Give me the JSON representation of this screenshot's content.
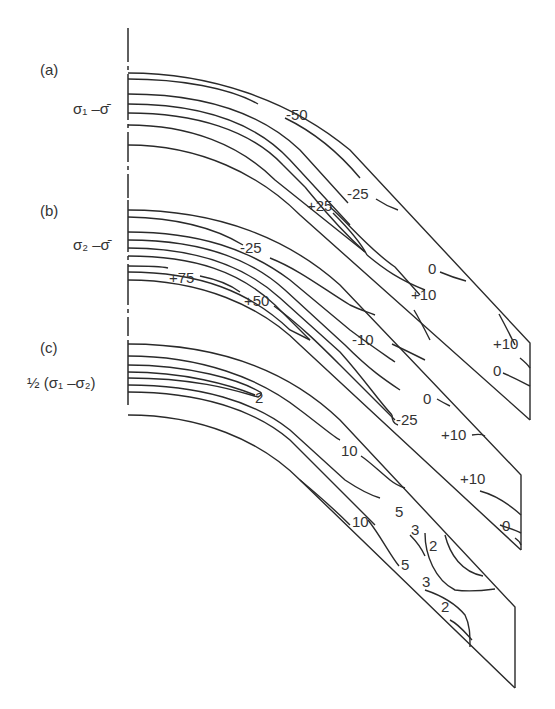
{
  "figure": {
    "type": "contour-diagram",
    "panels": [
      {
        "id": "a",
        "label": "(a)",
        "quantity": "σ₁ - σ̄",
        "quantity_display": "σ₁ –σ̄",
        "contour_labels": [
          "-50",
          "-25",
          "+25",
          "0",
          "+10",
          "+10",
          "0"
        ]
      },
      {
        "id": "b",
        "label": "(b)",
        "quantity": "σ₂ - σ̄",
        "quantity_display": "σ₂ –σ̄",
        "contour_labels": [
          "-25",
          "+75",
          "+50",
          "-10",
          "0",
          "-25",
          "+10",
          "+10",
          "0"
        ]
      },
      {
        "id": "c",
        "label": "(c)",
        "quantity": "½ (σ₁ - σ₂)",
        "quantity_display": "½ (σ₁ –σ₂)",
        "contour_labels": [
          "2",
          "10",
          "10",
          "5",
          "3",
          "2",
          "5",
          "3",
          "2"
        ]
      }
    ],
    "line_color": "#2a2a2a",
    "background": "#ffffff"
  }
}
